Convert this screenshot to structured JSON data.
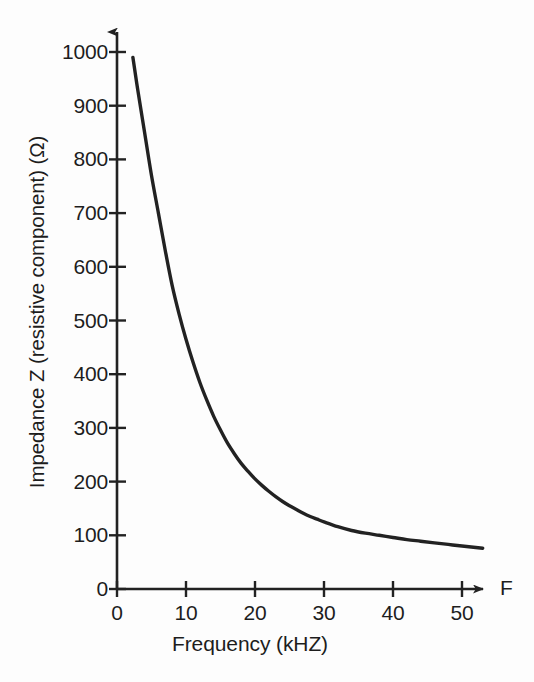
{
  "figure": {
    "background_color": "#fdfdfd",
    "ink_color": "#222222",
    "axis_end_label": "F"
  },
  "chart_data": {
    "type": "line",
    "title": "",
    "subtitle": "",
    "xlabel": "Frequency (kHZ)",
    "ylabel": "Impedance Z (resistive component) (Ω)",
    "xlim": [
      0,
      53
    ],
    "ylim": [
      0,
      1030
    ],
    "xticks": [
      0,
      10,
      20,
      30,
      40,
      50
    ],
    "xtick_labels": [
      "0",
      "10",
      "20",
      "30",
      "40",
      "50"
    ],
    "yticks": [
      0,
      100,
      200,
      300,
      400,
      500,
      600,
      700,
      800,
      900,
      1000
    ],
    "ytick_labels": [
      "0",
      "100",
      "200",
      "300",
      "400",
      "500",
      "600",
      "700",
      "800",
      "900",
      "1000"
    ],
    "grid": false,
    "legend": null,
    "legend_position": "none",
    "axis_arrows": {
      "x": true,
      "y": true
    },
    "annotations": [
      "F"
    ],
    "series": [
      {
        "name": "Impedance Z",
        "color": "#222222",
        "line_width": 3.4,
        "x": [
          2.3,
          3,
          4,
          5,
          6,
          7,
          8,
          9,
          10,
          11,
          12,
          13,
          14,
          15,
          16,
          17,
          18,
          19,
          20,
          21,
          22,
          23,
          24,
          25,
          26,
          27,
          28,
          29,
          30,
          32,
          34,
          36,
          38,
          40,
          42,
          44,
          46,
          48,
          50,
          53
        ],
        "y": [
          990,
          930,
          850,
          770,
          700,
          630,
          565,
          512,
          465,
          423,
          385,
          352,
          322,
          296,
          272,
          252,
          234,
          219,
          205,
          193,
          182,
          172,
          163,
          155,
          148,
          141,
          135,
          130,
          125,
          116,
          109,
          104,
          100,
          96,
          92,
          89,
          86,
          83,
          80,
          76
        ]
      }
    ]
  }
}
